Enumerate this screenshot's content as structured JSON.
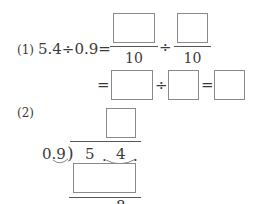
{
  "problem1": {
    "label": "(1)",
    "expression": "5.4÷0.9=",
    "fraction1": {
      "numerator_box": "",
      "denominator": "10"
    },
    "divide_symbol": "÷",
    "fraction2": {
      "numerator_box": "",
      "denominator": "10"
    },
    "line2": {
      "equals1": "=",
      "box1": "",
      "divide_symbol": "÷",
      "box2": "",
      "equals2": "=",
      "box3": ""
    }
  },
  "problem2": {
    "label": "(2)",
    "quotient_box": "",
    "divisor": "0.9",
    "bracket": ")",
    "dividend_digits": [
      "5",
      ".",
      "4",
      "."
    ],
    "product_box": "",
    "remainder_partial": "8"
  }
}
